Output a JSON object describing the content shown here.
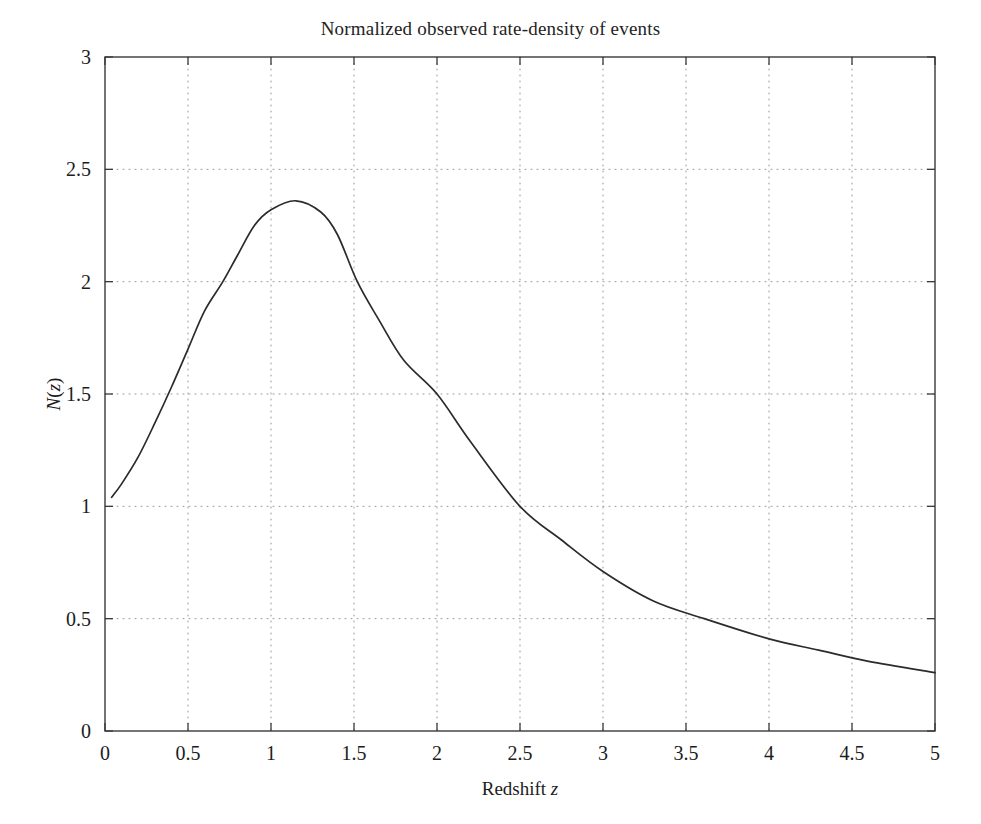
{
  "figure": {
    "width": 981,
    "height": 824,
    "background": "#ffffff"
  },
  "chart_data": {
    "type": "line",
    "title": "Normalized observed rate-density of events",
    "xlabel": "Redshift z",
    "ylabel": "N(z)",
    "xlim": [
      0,
      5
    ],
    "ylim": [
      0,
      3
    ],
    "grid": true,
    "grid_style": "dotted",
    "legend": null,
    "line_color": "#2b2b2b",
    "line_width": 1.7,
    "xticks": [
      0,
      0.5,
      1,
      1.5,
      2,
      2.5,
      3,
      3.5,
      4,
      4.5,
      5
    ],
    "xtick_labels": [
      "0",
      "0.5",
      "1",
      "1.5",
      "2",
      "2.5",
      "3",
      "3.5",
      "4",
      "4.5",
      "5"
    ],
    "yticks": [
      0,
      0.5,
      1,
      1.5,
      2,
      2.5,
      3
    ],
    "ytick_labels": [
      "0",
      "0.5",
      "1",
      "1.5",
      "2",
      "2.5",
      "3"
    ],
    "series": [
      {
        "name": "N(z)",
        "x": [
          0.04,
          0.1,
          0.2,
          0.3,
          0.4,
          0.5,
          0.6,
          0.71,
          0.8,
          0.9,
          1.0,
          1.15,
          1.3,
          1.4,
          1.52,
          1.65,
          1.8,
          2.0,
          2.2,
          2.5,
          2.75,
          3.0,
          3.3,
          3.61,
          4.0,
          4.3,
          4.6,
          5.0
        ],
        "y": [
          1.04,
          1.1,
          1.22,
          1.37,
          1.53,
          1.7,
          1.87,
          2.0,
          2.12,
          2.25,
          2.32,
          2.36,
          2.31,
          2.21,
          2.0,
          1.83,
          1.65,
          1.5,
          1.29,
          1.0,
          0.85,
          0.71,
          0.58,
          0.5,
          0.41,
          0.36,
          0.31,
          0.26
        ]
      }
    ],
    "peak": {
      "x": 1.15,
      "y": 2.36
    }
  }
}
